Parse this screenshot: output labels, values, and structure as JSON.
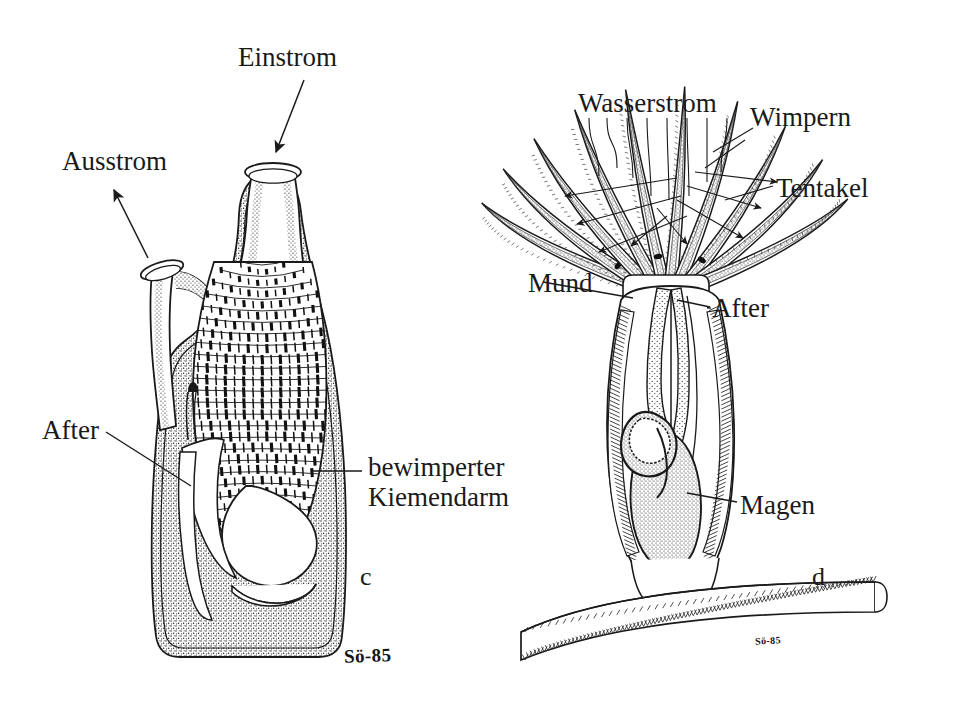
{
  "figure": {
    "title_visible": false,
    "background_color": "#ffffff",
    "ink_color": "#1a1a1a",
    "language": "de"
  },
  "panels": [
    {
      "id": "c",
      "letter": "c",
      "letter_pos": {
        "x": 360,
        "y": 562
      },
      "signature": "Sö-85",
      "signature_pos": {
        "x": 344,
        "y": 645
      },
      "subject": "Seescheide (Ascidie) im Längsschnitt",
      "labels": [
        {
          "name": "einstrom",
          "text": "Einstrom",
          "x": 238,
          "y": 42,
          "align": "left"
        },
        {
          "name": "ausstrom",
          "text": "Ausstrom",
          "x": 62,
          "y": 146,
          "align": "left"
        },
        {
          "name": "after",
          "text": "After",
          "x": 42,
          "y": 415,
          "align": "left"
        },
        {
          "name": "bewimperter-kiemendarm",
          "text": "bewimperter\nKiemendarm",
          "x": 368,
          "y": 452,
          "align": "left"
        }
      ]
    },
    {
      "id": "d",
      "letter": "d",
      "letter_pos": {
        "x": 812,
        "y": 562
      },
      "signature": "Sö-85",
      "signature_pos": {
        "x": 755,
        "y": 635
      },
      "subject": "Kragengeisseltier / Kelchtierchen mit Tentakelkranz",
      "labels": [
        {
          "name": "wasserstrom",
          "text": "Wasserstrom",
          "x": 578,
          "y": 88,
          "align": "left"
        },
        {
          "name": "wimpern",
          "text": "Wimpern",
          "x": 750,
          "y": 102,
          "align": "left"
        },
        {
          "name": "tentakel",
          "text": "Tentakel",
          "x": 776,
          "y": 173,
          "align": "left"
        },
        {
          "name": "mund",
          "text": "Mund",
          "x": 528,
          "y": 268,
          "align": "left"
        },
        {
          "name": "after",
          "text": "After",
          "x": 712,
          "y": 293,
          "align": "left"
        },
        {
          "name": "magen",
          "text": "Magen",
          "x": 740,
          "y": 490,
          "align": "left"
        }
      ]
    }
  ],
  "chart_data": {
    "type": "diagram",
    "panel_labels": [
      "c",
      "d"
    ],
    "annotations": [
      "Einstrom",
      "Ausstrom",
      "After",
      "bewimperter Kiemendarm",
      "Wasserstrom",
      "Wimpern",
      "Tentakel",
      "Mund",
      "After",
      "Magen"
    ],
    "signatures": [
      "Sö-85",
      "Sö-85"
    ]
  }
}
